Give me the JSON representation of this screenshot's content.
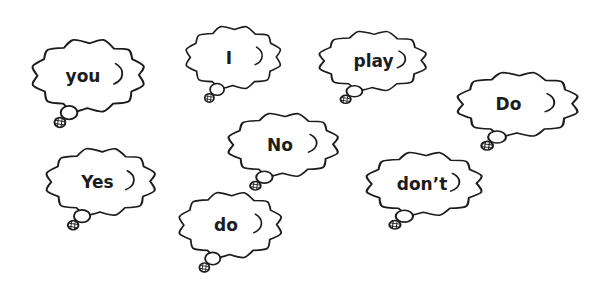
{
  "page": {
    "background_color": "#ffffff",
    "ink_color": "#1c1c1c"
  },
  "clouds": [
    {
      "id": "you",
      "label": "you"
    },
    {
      "id": "i",
      "label": "I"
    },
    {
      "id": "play",
      "label": "play"
    },
    {
      "id": "do-upper",
      "label": "Do"
    },
    {
      "id": "no",
      "label": "No"
    },
    {
      "id": "yes",
      "label": "Yes"
    },
    {
      "id": "do-lower",
      "label": "do"
    },
    {
      "id": "dont",
      "label": "don’t"
    }
  ]
}
